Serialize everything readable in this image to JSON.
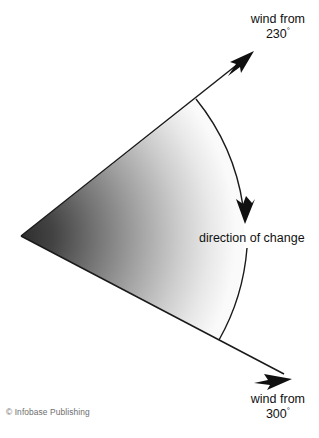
{
  "figure": {
    "background_color": "#ffffff",
    "line_color": "#1a1a1a",
    "sector": {
      "apex": [
        21,
        236
      ],
      "upper_corner": [
        196,
        99
      ],
      "lower_corner": [
        219,
        340
      ],
      "gradient_dark": "#383838",
      "gradient_light": "#f7f7f7",
      "gradient_description": "dark at apex fading to near-white at the arc"
    },
    "rays": [
      {
        "name": "upper-ray",
        "from": [
          21,
          236
        ],
        "to": [
          253,
          52
        ],
        "arrowhead": "at tip",
        "bearing_label": "230"
      },
      {
        "name": "lower-ray",
        "from": [
          21,
          236
        ],
        "to": [
          290,
          378
        ],
        "arrowhead": "at tip",
        "bearing_label": "300"
      }
    ],
    "arc": {
      "name": "direction-of-change-arc",
      "from": [
        196,
        99
      ],
      "to": [
        219,
        340
      ],
      "arrowhead_at": [
        245,
        221
      ],
      "arrowhead_direction": "downward",
      "bulge": "outward to the right"
    }
  },
  "labels": {
    "wind_from_230": {
      "line1": "wind from",
      "line2": "230",
      "degree": "°"
    },
    "wind_from_300": {
      "line1": "wind from",
      "line2": "300",
      "degree": "°"
    },
    "direction_of_change": "direction of change"
  },
  "credit": "© Infobase Publishing",
  "icons": {
    "arrowhead": "arrowhead-icon",
    "curved_arrow": "curved-arrow-icon"
  }
}
